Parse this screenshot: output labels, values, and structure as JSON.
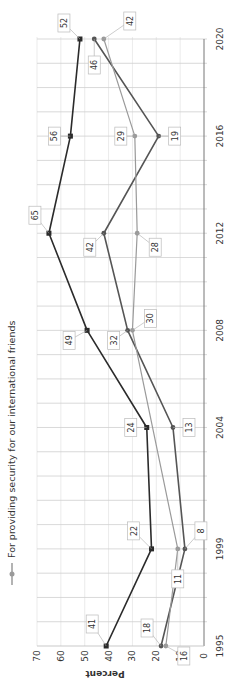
{
  "chart_data": {
    "type": "line",
    "orientation": "rotated-90-ccw",
    "title": "",
    "xlabel": "",
    "ylabel": "Percent",
    "ylim": [
      0,
      70
    ],
    "yticks": [
      0,
      10,
      20,
      30,
      40,
      50,
      60,
      70
    ],
    "xlim": [
      1995,
      2020
    ],
    "xticks": [
      1995,
      1999,
      2004,
      2008,
      2012,
      2016,
      2020
    ],
    "grid": true,
    "legend_position": "top",
    "legend": [
      "For providing security for our international friends"
    ],
    "series": [
      {
        "name": "Series A (dark, square markers)",
        "color": "#2b2b2b",
        "marker": "square",
        "x": [
          1995,
          1999,
          2004,
          2008,
          2012,
          2016,
          2020
        ],
        "values": [
          41,
          22,
          24,
          49,
          65,
          56,
          52
        ]
      },
      {
        "name": "Series B (medium, circle markers)",
        "color": "#555555",
        "marker": "circle",
        "x": [
          1995,
          1999,
          2004,
          2008,
          2012,
          2016,
          2020
        ],
        "values": [
          18,
          8,
          13,
          32,
          42,
          19,
          46
        ]
      },
      {
        "name": "For providing security for our international friends",
        "color": "#9a9a9a",
        "marker": "circle",
        "x": [
          1995,
          1999,
          2008,
          2012,
          2016,
          2020
        ],
        "values": [
          16,
          11,
          30,
          28,
          29,
          42
        ]
      }
    ]
  },
  "axis": {
    "y_title": "Percent",
    "x_tick_labels": [
      "1995",
      "1999",
      "2004",
      "2008",
      "2012",
      "2016",
      "2020"
    ],
    "y_tick_labels": [
      "0",
      "10",
      "20",
      "30",
      "40",
      "50",
      "60",
      "70"
    ]
  },
  "legend": {
    "label": "For providing security for our international friends"
  }
}
